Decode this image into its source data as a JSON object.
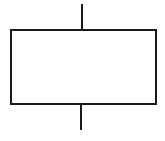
{
  "diagram": {
    "type": "block-symbol",
    "stroke_color": "#1a1a1a",
    "background": "#ffffff",
    "stroke_width": 2,
    "shapes": {
      "top_lead": {
        "x1": 82,
        "y1": 4,
        "x2": 82,
        "y2": 30
      },
      "box": {
        "x": 11,
        "y": 30,
        "width": 145,
        "height": 74
      },
      "bottom_lead": {
        "x1": 81,
        "y1": 104,
        "x2": 81,
        "y2": 130
      }
    }
  }
}
